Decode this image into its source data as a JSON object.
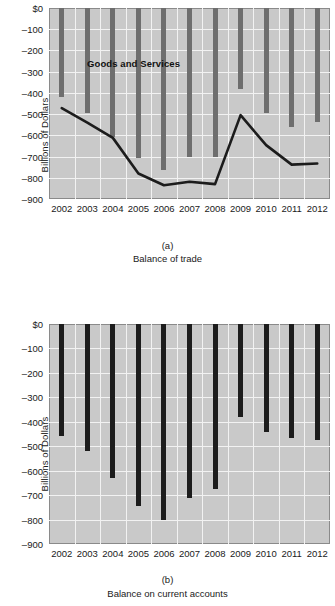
{
  "chart_data": [
    {
      "type": "bar",
      "panel": "a",
      "title": "Balance of trade",
      "panel_label": "(a)",
      "xlabel": "",
      "ylabel": "Billions of Dollars",
      "categories": [
        "2002",
        "2003",
        "2004",
        "2005",
        "2006",
        "2007",
        "2008",
        "2009",
        "2010",
        "2011",
        "2012"
      ],
      "ylim": [
        -900,
        0
      ],
      "ytick_labels": [
        "$0",
        "–100",
        "–200",
        "–300",
        "–400",
        "–500",
        "–600",
        "–700",
        "–800",
        "–900"
      ],
      "ytick_values": [
        0,
        -100,
        -200,
        -300,
        -400,
        -500,
        -600,
        -700,
        -800,
        -900
      ],
      "grid": true,
      "legend": "annotations",
      "series": [
        {
          "name": "Goods and Services",
          "render": "bar",
          "color": "#6e6e6e",
          "annotation": "Goods and Services",
          "values": [
            -418,
            -494,
            -610,
            -709,
            -762,
            -700,
            -702,
            -381,
            -495,
            -559,
            -537
          ]
        },
        {
          "name": "Goods",
          "render": "line",
          "color": "#1c1c1c",
          "annotation": "Goods",
          "values": [
            -472,
            -540,
            -612,
            -780,
            -835,
            -819,
            -830,
            -505,
            -646,
            -738,
            -733
          ]
        }
      ]
    },
    {
      "type": "bar",
      "panel": "b",
      "title": "Balance on current accounts",
      "panel_label": "(b)",
      "xlabel": "",
      "ylabel": "Billions of Dollars",
      "categories": [
        "2002",
        "2003",
        "2004",
        "2005",
        "2006",
        "2007",
        "2008",
        "2009",
        "2010",
        "2011",
        "2012"
      ],
      "ylim": [
        -900,
        0
      ],
      "ytick_labels": [
        "$0",
        "–100",
        "–200",
        "–300",
        "–400",
        "–500",
        "–600",
        "–700",
        "–800",
        "–900"
      ],
      "ytick_values": [
        0,
        -100,
        -200,
        -300,
        -400,
        -500,
        -600,
        -700,
        -800,
        -900
      ],
      "grid": true,
      "series": [
        {
          "name": "Balance on current accounts",
          "render": "bar",
          "color": "#1c1c1c",
          "values": [
            -459,
            -521,
            -632,
            -745,
            -801,
            -711,
            -677,
            -381,
            -442,
            -466,
            -475
          ]
        }
      ]
    }
  ]
}
